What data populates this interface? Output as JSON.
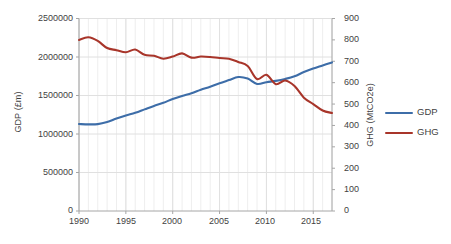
{
  "chart_data": {
    "type": "line",
    "title": "",
    "xlabel": "",
    "ylabel": "GDP (£m)",
    "y2label": "GHG (MtCO2e)",
    "grid": true,
    "legend_position": "right",
    "x": [
      1990,
      1991,
      1992,
      1993,
      1994,
      1995,
      1996,
      1997,
      1998,
      1999,
      2000,
      2001,
      2002,
      2003,
      2004,
      2005,
      2006,
      2007,
      2008,
      2009,
      2010,
      2011,
      2012,
      2013,
      2014,
      2015,
      2016,
      2017
    ],
    "xlim": [
      1990,
      2017
    ],
    "xticks": [
      1990,
      1995,
      2000,
      2005,
      2010,
      2015
    ],
    "ylim": [
      0,
      2500000
    ],
    "yticks": [
      0,
      500000,
      1000000,
      1500000,
      2000000,
      2500000
    ],
    "y2lim": [
      0,
      900
    ],
    "y2ticks": [
      0,
      100,
      200,
      300,
      400,
      500,
      600,
      700,
      800,
      900
    ],
    "series": [
      {
        "name": "GDP",
        "axis": "left",
        "color": "#3d6da8",
        "unit": "£m",
        "values": [
          1130000,
          1125000,
          1128000,
          1155000,
          1200000,
          1240000,
          1275000,
          1320000,
          1365000,
          1405000,
          1455000,
          1495000,
          1530000,
          1575000,
          1615000,
          1660000,
          1700000,
          1740000,
          1720000,
          1650000,
          1672000,
          1690000,
          1715000,
          1750000,
          1805000,
          1850000,
          1890000,
          1930000
        ]
      },
      {
        "name": "GHG",
        "axis": "right",
        "color": "#a8352a",
        "unit": "MtCO2e",
        "values": [
          800,
          812,
          795,
          762,
          752,
          742,
          755,
          730,
          726,
          712,
          722,
          737,
          717,
          722,
          720,
          715,
          712,
          697,
          678,
          617,
          637,
          593,
          610,
          584,
          530,
          500,
          470,
          458
        ]
      }
    ]
  },
  "axes": {
    "y_left_title": "GDP (£m)",
    "y_right_title": "GHG (MtCO2e)",
    "y_left_ticks": [
      "2500000",
      "2000000",
      "1500000",
      "1000000",
      "500000",
      "0"
    ],
    "y_right_ticks": [
      "900",
      "800",
      "700",
      "600",
      "500",
      "400",
      "300",
      "200",
      "100",
      "0"
    ],
    "x_ticks": [
      "1990",
      "1995",
      "2000",
      "2005",
      "2010",
      "2015"
    ]
  },
  "legend": {
    "items": [
      {
        "label": "GDP",
        "color": "#3d6da8"
      },
      {
        "label": "GHG",
        "color": "#a8352a"
      }
    ]
  }
}
